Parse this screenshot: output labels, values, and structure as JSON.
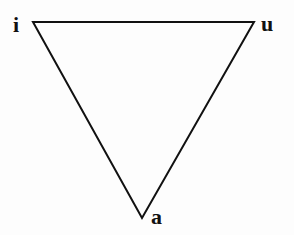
{
  "diagram": {
    "type": "vowel-triangle",
    "vertices": [
      {
        "id": "i",
        "label": "i",
        "x": 33,
        "y": 22
      },
      {
        "id": "u",
        "label": "u",
        "x": 254,
        "y": 22
      },
      {
        "id": "a",
        "label": "a",
        "x": 142,
        "y": 218
      }
    ],
    "edges": [
      [
        "i",
        "u"
      ],
      [
        "u",
        "a"
      ],
      [
        "a",
        "i"
      ]
    ],
    "line_color": "#111111"
  }
}
